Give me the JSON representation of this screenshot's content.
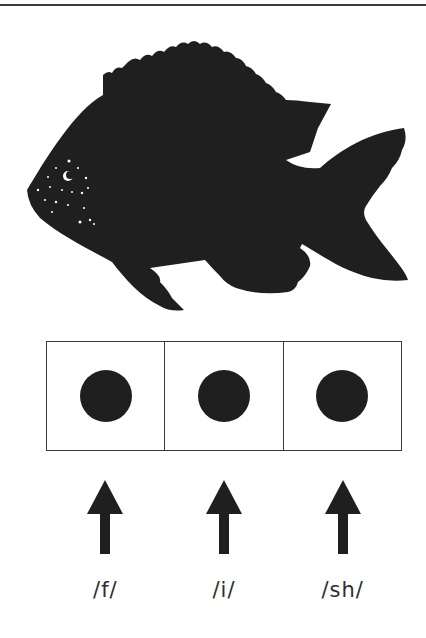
{
  "figure": {
    "image_icon": "fish-silhouette",
    "colors": {
      "ink": "#1f1f1f",
      "rule": "#3a3a3a",
      "text": "#2e2e2e",
      "background": "#ffffff"
    }
  },
  "elkonin_boxes": {
    "count": 3,
    "boxes": [
      {
        "token": "filled-circle",
        "phoneme": "/f/"
      },
      {
        "token": "filled-circle",
        "phoneme": "/i/"
      },
      {
        "token": "filled-circle",
        "phoneme": "/sh/"
      }
    ]
  },
  "arrows": {
    "direction": "up",
    "icon": "arrow-up-icon",
    "count": 3
  }
}
